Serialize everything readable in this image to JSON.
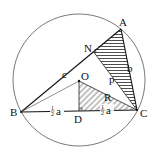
{
  "diagram": {
    "points": {
      "A": "A",
      "B": "B",
      "C": "C",
      "O": "O",
      "D": "D",
      "N": "N"
    },
    "side_labels": {
      "c": "c",
      "b": "b",
      "p": "p",
      "R": "R"
    },
    "half_a_left": {
      "num": "1",
      "den": "2",
      "var": "a"
    },
    "half_a_right": {
      "num": "1",
      "den": "2",
      "var": "a"
    },
    "colors": {
      "stroke": "#111111",
      "hatch": "#222222",
      "background": "#ffffff"
    }
  }
}
